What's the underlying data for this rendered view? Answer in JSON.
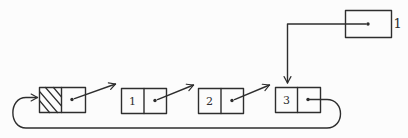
{
  "figure": {
    "pointer_box": {
      "label": "1"
    },
    "nodes": [
      {
        "id": "header",
        "value": ""
      },
      {
        "id": "node-1",
        "value": "1"
      },
      {
        "id": "node-2",
        "value": "2"
      },
      {
        "id": "node-3",
        "value": "3"
      }
    ],
    "colors": {
      "ink": "#2e2e2e",
      "background": "#fcfcfc"
    }
  }
}
